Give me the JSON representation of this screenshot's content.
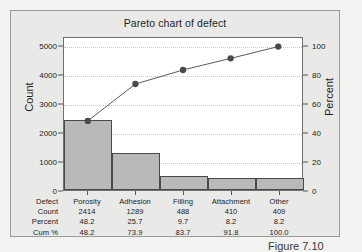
{
  "chart_data": {
    "type": "bar",
    "title": "Pareto chart of defect",
    "xlabel": "",
    "ylabel": "Count",
    "y2label": "Percent",
    "categories": [
      "Porosity",
      "Adhesion",
      "Filling",
      "Attachment",
      "Other"
    ],
    "values": [
      2414,
      1289,
      488,
      410,
      409
    ],
    "series": [
      {
        "name": "Count",
        "values": [
          2414,
          1289,
          488,
          410,
          409
        ],
        "axis": "left",
        "type": "bar"
      },
      {
        "name": "Cum %",
        "values": [
          48.2,
          73.9,
          83.7,
          91.8,
          100.0
        ],
        "axis": "right",
        "type": "line"
      }
    ],
    "percent": [
      48.2,
      25.7,
      9.7,
      8.2,
      8.2
    ],
    "cum_percent": [
      48.2,
      73.9,
      83.7,
      91.8,
      100.0
    ],
    "ylim": [
      0,
      5300
    ],
    "y2lim": [
      0,
      106
    ],
    "yticks": [
      0,
      1000,
      2000,
      3000,
      4000,
      5000
    ],
    "y2ticks": [
      0,
      20,
      40,
      60,
      80,
      100
    ],
    "ytick_labels": [
      "0",
      "1000",
      "2000",
      "3000",
      "4000",
      "5000"
    ],
    "y2tick_labels": [
      "0",
      "20",
      "40",
      "60",
      "80",
      "100"
    ],
    "grid": true,
    "legend": "none",
    "bar_color": "#b9b9b9",
    "bar_edge_color": "#4a4a4a",
    "line_color": "#5a5a5a",
    "marker_color": "#4a4a4a",
    "plot_background": "#ffffff",
    "panel_background": "#e9e9e7"
  },
  "table": {
    "row_labels": [
      "Defect",
      "Count",
      "Percent",
      "Cum %"
    ],
    "rows": [
      {
        "label": "Defect",
        "cells": [
          "Porosity",
          "Adhesion",
          "Filling",
          "Attachment",
          "Other"
        ]
      },
      {
        "label": "Count",
        "cells": [
          "2414",
          "1289",
          "488",
          "410",
          "409"
        ]
      },
      {
        "label": "Percent",
        "cells": [
          "48.2",
          "25.7",
          "9.7",
          "8.2",
          "8.2"
        ]
      },
      {
        "label": "Cum %",
        "cells": [
          "48.2",
          "73.9",
          "83.7",
          "91.8",
          "100.0"
        ]
      }
    ]
  },
  "caption": "Figure 7.10"
}
